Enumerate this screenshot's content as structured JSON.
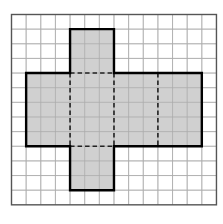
{
  "diagram": {
    "grid": {
      "origin_x": 11.5,
      "origin_y": 14.5,
      "cols": 14,
      "rows": 13,
      "cell": 14.64,
      "line_color": "#c4c4c4",
      "border_color": "#555555",
      "background": "#ffffff"
    },
    "net": {
      "fill": "#c8c8c8",
      "outline_color": "#000000",
      "fold_color": "#222222",
      "faces": [
        {
          "name": "top-tab",
          "col": 4,
          "row": 1,
          "w": 3,
          "h": 3
        },
        {
          "name": "face-1",
          "col": 1,
          "row": 4,
          "w": 3,
          "h": 5
        },
        {
          "name": "face-2",
          "col": 4,
          "row": 4,
          "w": 3,
          "h": 5
        },
        {
          "name": "face-3",
          "col": 7,
          "row": 4,
          "w": 3,
          "h": 5
        },
        {
          "name": "face-4",
          "col": 10,
          "row": 4,
          "w": 3,
          "h": 5
        },
        {
          "name": "bottom-tab",
          "col": 4,
          "row": 9,
          "w": 3,
          "h": 3
        }
      ],
      "outline": [
        [
          4,
          1
        ],
        [
          7,
          1
        ],
        [
          7,
          4
        ],
        [
          13,
          4
        ],
        [
          13,
          9
        ],
        [
          7,
          9
        ],
        [
          7,
          12
        ],
        [
          4,
          12
        ],
        [
          4,
          9
        ],
        [
          1,
          9
        ],
        [
          1,
          4
        ],
        [
          4,
          4
        ]
      ],
      "fold_lines": [
        [
          [
            4,
            4
          ],
          [
            7,
            4
          ]
        ],
        [
          [
            4,
            9
          ],
          [
            7,
            9
          ]
        ],
        [
          [
            4,
            4
          ],
          [
            4,
            9
          ]
        ],
        [
          [
            7,
            4
          ],
          [
            7,
            9
          ]
        ],
        [
          [
            10,
            4
          ],
          [
            10,
            9
          ]
        ]
      ]
    }
  }
}
